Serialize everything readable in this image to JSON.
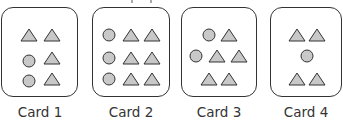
{
  "figure": {
    "colors": {
      "shape_fill": "#c8c8c8",
      "stroke": "#333333",
      "background": "#ffffff"
    },
    "cards": [
      {
        "label": "Card 1",
        "circles": 2,
        "triangles": 4,
        "layout": [
          [
            "triangle",
            "triangle"
          ],
          [
            "circle",
            "triangle"
          ],
          [
            "circle",
            "triangle"
          ]
        ]
      },
      {
        "label": "Card 2",
        "circles": 3,
        "triangles": 6,
        "layout": [
          [
            "circle",
            "triangle",
            "triangle"
          ],
          [
            "circle",
            "triangle",
            "triangle"
          ],
          [
            "circle",
            "triangle",
            "triangle"
          ]
        ]
      },
      {
        "label": "Card 3",
        "circles": 2,
        "triangles": 5,
        "layout": [
          [
            "circle",
            "triangle"
          ],
          [
            "circle",
            "triangle",
            "triangle"
          ],
          [
            "triangle",
            "triangle"
          ]
        ]
      },
      {
        "label": "Card 4",
        "circles": 1,
        "triangles": 4,
        "layout": [
          [
            "triangle",
            "triangle"
          ],
          [
            "circle"
          ],
          [
            "triangle",
            "triangle"
          ]
        ]
      }
    ]
  }
}
